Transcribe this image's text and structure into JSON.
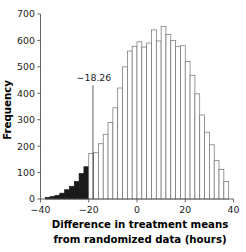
{
  "chart_data": {
    "type": "bar",
    "title": "",
    "subtitle": "",
    "xlabel_line1": "Difference in treatment means",
    "xlabel_line2": "from randomized data (hours)",
    "ylabel": "Frequency",
    "xlim": [
      -40,
      40
    ],
    "ylim": [
      0,
      700
    ],
    "xticks": [
      -40,
      -20,
      0,
      20,
      40
    ],
    "xtick_labels": [
      "−40",
      "−20",
      "0",
      "20",
      "40"
    ],
    "yticks": [
      0,
      100,
      200,
      300,
      400,
      500,
      600,
      700
    ],
    "ytick_labels": [
      "0",
      "100",
      "200",
      "300",
      "400",
      "500",
      "600",
      "700"
    ],
    "grid": false,
    "legend": null,
    "bin_width": 2,
    "bar_fill_default": "#ffffff",
    "bar_fill_highlight": "#1a1a1a",
    "bar_edge_color": "#6e6e6e",
    "highlight_max_x": -18.26,
    "annotations": [
      {
        "name": "observed-difference-marker",
        "label": "−18.26",
        "x": -18.26,
        "line_top_y": 430,
        "line_bottom_y": 0
      }
    ],
    "categories": [
      -37,
      -35,
      -33,
      -31,
      -29,
      -27,
      -25,
      -23,
      -21,
      -19,
      -17,
      -15,
      -13,
      -11,
      -9,
      -7,
      -5,
      -3,
      -1,
      1,
      3,
      5,
      7,
      9,
      11,
      13,
      15,
      17,
      19,
      21,
      23,
      25,
      27,
      29,
      31,
      33,
      35,
      37
    ],
    "values": [
      6,
      9,
      14,
      22,
      35,
      48,
      66,
      96,
      122,
      172,
      175,
      209,
      245,
      290,
      345,
      420,
      500,
      560,
      578,
      595,
      575,
      590,
      640,
      598,
      653,
      622,
      600,
      578,
      580,
      520,
      468,
      398,
      318,
      253,
      205,
      145,
      112,
      66
    ],
    "tail_extra": {
      "categories": [
        27,
        29,
        31,
        33,
        35,
        37
      ],
      "values": [
        68,
        45,
        30,
        22,
        14,
        8
      ]
    }
  }
}
